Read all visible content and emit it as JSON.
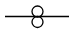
{
  "diagram": {
    "type": "schematic-symbol",
    "symbol": "transformer",
    "stroke_color": "#000000",
    "background": "#ffffff",
    "line": {
      "x1": 5,
      "y1": 16.5,
      "x2": 69,
      "y2": 16.5
    },
    "coils": [
      {
        "cx": 37.5,
        "cy": 11.5,
        "r": 5.5
      },
      {
        "cx": 37.5,
        "cy": 22,
        "r": 5.5
      }
    ]
  }
}
